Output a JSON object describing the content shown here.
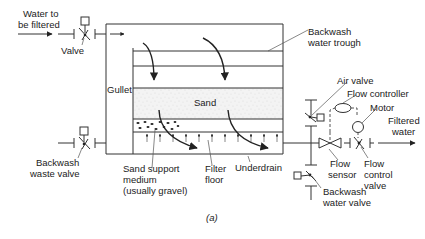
{
  "figure_label": "(a)",
  "labels": {
    "water_to_be_filtered_1": "Water to",
    "water_to_be_filtered_2": "be filtered",
    "valve": "Valve",
    "gullet": "Gullet",
    "backwash_trough_1": "Backwash",
    "backwash_trough_2": "water trough",
    "sand": "Sand",
    "backwash_waste_valve_1": "Backwash",
    "backwash_waste_valve_2": "waste valve",
    "sand_support_1": "Sand support",
    "sand_support_2": "medium",
    "sand_support_3": "(usually gravel)",
    "filter_floor_1": "Filter",
    "filter_floor_2": "floor",
    "underdrain": "Underdrain",
    "air_valve": "Air valve",
    "flow_controller": "Flow controller",
    "motor": "Motor",
    "filtered_water_1": "Filtered",
    "filtered_water_2": "water",
    "flow_sensor_1": "Flow",
    "flow_sensor_2": "sensor",
    "flow_control_valve_1": "Flow",
    "flow_control_valve_2": "control",
    "flow_control_valve_3": "valve",
    "backwash_water_valve_1": "Backwash",
    "backwash_water_valve_2": "water valve"
  }
}
